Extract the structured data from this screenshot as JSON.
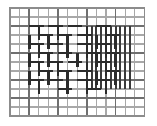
{
  "figure": {
    "type": "line-lattice-illusion",
    "caption": "",
    "background_color": "#ffffff"
  },
  "canvas": {
    "width": 157,
    "height": 126
  },
  "lattice": {
    "description": "Regular rectangular grid of thin light-gray lines forming the background lattice",
    "origin_x": 10,
    "origin_y": 8,
    "cell_width": 9.6,
    "cell_height": 9.0,
    "columns": 14,
    "rows": 12,
    "line_color": "#a8a8a8",
    "line_width": 1.1,
    "border_color": "#8c8c8c",
    "border_width": 1.3
  },
  "emphasis_lines": {
    "description": "Slightly darker full-length lattice lines",
    "color": "#6f6f6f",
    "line_width": 1.5,
    "vertical_columns": [
      2,
      5,
      8,
      11
    ],
    "horizontal_rows": [
      2,
      5,
      8,
      10
    ]
  },
  "central_pattern": {
    "description": "Central region of short thick dark segments in woven brick arrangement creating the illusion",
    "col_start": 2,
    "col_end": 12,
    "row_start": 2,
    "row_end": 10,
    "segment_color": "#2b2b2b",
    "segment_width": 2.6,
    "segment_length_cells": 1.6,
    "horizontal_segments": [
      {
        "col": 2,
        "row": 2,
        "len": 1.5
      },
      {
        "col": 4,
        "row": 2,
        "len": 1.5
      },
      {
        "col": 6,
        "row": 2,
        "len": 1.5
      },
      {
        "col": 9,
        "row": 2,
        "len": 1.5
      },
      {
        "col": 3,
        "row": 3,
        "len": 1.5
      },
      {
        "col": 5,
        "row": 3,
        "len": 1.5
      },
      {
        "col": 7,
        "row": 3,
        "len": 1.5
      },
      {
        "col": 10,
        "row": 3,
        "len": 1.5
      },
      {
        "col": 2,
        "row": 4,
        "len": 1.5
      },
      {
        "col": 4,
        "row": 4,
        "len": 1.5
      },
      {
        "col": 7,
        "row": 4,
        "len": 1.5
      },
      {
        "col": 9,
        "row": 4,
        "len": 1.5
      },
      {
        "col": 3,
        "row": 5,
        "len": 1.5
      },
      {
        "col": 5,
        "row": 5,
        "len": 1.5
      },
      {
        "col": 8,
        "row": 5,
        "len": 1.5
      },
      {
        "col": 10,
        "row": 5,
        "len": 1.5
      },
      {
        "col": 2,
        "row": 6,
        "len": 1.5
      },
      {
        "col": 4,
        "row": 6,
        "len": 1.5
      },
      {
        "col": 6,
        "row": 6,
        "len": 1.5
      },
      {
        "col": 9,
        "row": 6,
        "len": 1.5
      },
      {
        "col": 3,
        "row": 7,
        "len": 1.5
      },
      {
        "col": 5,
        "row": 7,
        "len": 1.5
      },
      {
        "col": 7,
        "row": 7,
        "len": 1.5
      },
      {
        "col": 10,
        "row": 7,
        "len": 1.5
      },
      {
        "col": 2,
        "row": 8,
        "len": 1.5
      },
      {
        "col": 4,
        "row": 8,
        "len": 1.5
      },
      {
        "col": 7,
        "row": 8,
        "len": 1.5
      },
      {
        "col": 9,
        "row": 8,
        "len": 1.5
      },
      {
        "col": 5,
        "row": 9,
        "len": 1.5
      },
      {
        "col": 8,
        "row": 9,
        "len": 1.5
      }
    ],
    "vertical_segments": [
      {
        "col": 3,
        "row": 2,
        "len": 1.5
      },
      {
        "col": 5,
        "row": 2,
        "len": 1.5
      },
      {
        "col": 8,
        "row": 2,
        "len": 1.5
      },
      {
        "col": 10,
        "row": 2,
        "len": 1.5
      },
      {
        "col": 2,
        "row": 3,
        "len": 1.5
      },
      {
        "col": 4,
        "row": 3,
        "len": 1.5
      },
      {
        "col": 6,
        "row": 3,
        "len": 1.5
      },
      {
        "col": 9,
        "row": 3,
        "len": 1.5
      },
      {
        "col": 11,
        "row": 3,
        "len": 1.5
      },
      {
        "col": 3,
        "row": 4,
        "len": 1.5
      },
      {
        "col": 6,
        "row": 4,
        "len": 1.5
      },
      {
        "col": 8,
        "row": 4,
        "len": 1.5
      },
      {
        "col": 10,
        "row": 4,
        "len": 1.5
      },
      {
        "col": 2,
        "row": 5,
        "len": 1.5
      },
      {
        "col": 4,
        "row": 5,
        "len": 1.5
      },
      {
        "col": 7,
        "row": 5,
        "len": 1.5
      },
      {
        "col": 9,
        "row": 5,
        "len": 1.5
      },
      {
        "col": 11,
        "row": 5,
        "len": 1.5
      },
      {
        "col": 3,
        "row": 6,
        "len": 1.5
      },
      {
        "col": 5,
        "row": 6,
        "len": 1.5
      },
      {
        "col": 8,
        "row": 6,
        "len": 1.5
      },
      {
        "col": 10,
        "row": 6,
        "len": 1.5
      },
      {
        "col": 2,
        "row": 7,
        "len": 1.5
      },
      {
        "col": 4,
        "row": 7,
        "len": 1.5
      },
      {
        "col": 6,
        "row": 7,
        "len": 1.5
      },
      {
        "col": 9,
        "row": 7,
        "len": 1.5
      },
      {
        "col": 11,
        "row": 7,
        "len": 1.5
      },
      {
        "col": 3,
        "row": 8,
        "len": 1.5
      },
      {
        "col": 6,
        "row": 8,
        "len": 1.5
      },
      {
        "col": 8,
        "row": 8,
        "len": 1.5
      },
      {
        "col": 10,
        "row": 8,
        "len": 1.5
      }
    ]
  },
  "dense_band": {
    "description": "Right-of-center band of long vertical dark lines spanning most of the figure height",
    "columns": [
      8,
      9,
      10,
      11,
      12
    ],
    "row_start": 2,
    "row_end": 9,
    "color": "#3a3a3a",
    "line_width": 1.9
  }
}
